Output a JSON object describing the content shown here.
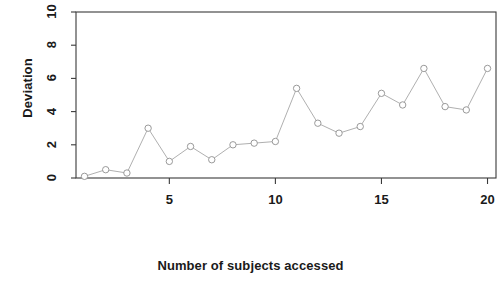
{
  "chart_data": {
    "type": "line",
    "title": "",
    "subtitle": "",
    "xlabel": "Number of subjects accessed",
    "ylabel": "Deviation",
    "x": [
      1,
      2,
      3,
      4,
      5,
      6,
      7,
      8,
      9,
      10,
      11,
      12,
      13,
      14,
      15,
      16,
      17,
      18,
      19,
      20
    ],
    "values": [
      0.1,
      0.5,
      0.3,
      3.0,
      1.0,
      1.9,
      1.1,
      2.0,
      2.1,
      2.2,
      5.4,
      3.3,
      2.7,
      3.1,
      5.1,
      4.4,
      6.6,
      4.3,
      4.1,
      6.6
    ],
    "series": [
      {
        "name": "Deviation",
        "values": [
          0.1,
          0.5,
          0.3,
          3.0,
          1.0,
          1.9,
          1.1,
          2.0,
          2.1,
          2.2,
          5.4,
          3.3,
          2.7,
          3.1,
          5.1,
          4.4,
          6.6,
          4.3,
          4.1,
          6.6
        ]
      }
    ],
    "xlim": [
      0.6,
      20.4
    ],
    "ylim": [
      0,
      10
    ],
    "xticks": [
      5,
      10,
      15,
      20
    ],
    "xtick_labels": [
      "5",
      "10",
      "15",
      "20"
    ],
    "yticks": [
      0,
      2,
      4,
      6,
      8,
      10
    ],
    "ytick_labels": [
      "0",
      "2",
      "4",
      "6",
      "8",
      "10"
    ],
    "grid": false,
    "legend": null,
    "legend_position": "none",
    "marker": "open-circle",
    "line_style": "solid",
    "line_color": "#9a9a9a",
    "marker_color": "#8f8f8f",
    "axis_color": "#3a3a3a",
    "background_color": "#ffffff"
  },
  "axis": {
    "y_label": "Deviation",
    "x_label": "Number of subjects accessed"
  }
}
